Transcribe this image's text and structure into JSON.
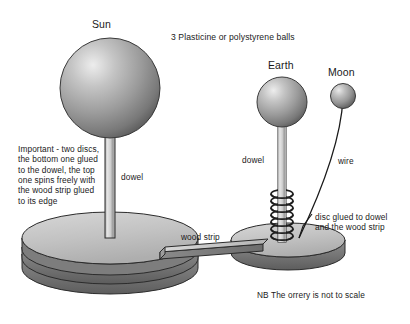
{
  "diagram": {
    "title_visible": false,
    "background_color": "#ffffff",
    "text_color": "#1a1a1a",
    "labels": {
      "sun": "Sun",
      "earth": "Earth",
      "moon": "Moon",
      "balls_note": "3 Plasticine or polystyrene balls",
      "important_note": "Important - two discs,\nthe bottom one glued\nto the dowel, the top\none spins freely with\nthe wood strip glued\nto its edge",
      "dowel_sun": "dowel",
      "dowel_earth": "dowel",
      "wire": "wire",
      "disc_glued_note": "disc glued to dowel\nand the wood strip",
      "wood_strip": "wood strip",
      "scale_note": "NB The orrery is not to scale"
    },
    "parts": {
      "sun_ball": "sun-sphere",
      "earth_ball": "earth-sphere",
      "moon_ball": "moon-sphere",
      "sun_dowel": "sun-dowel-rod",
      "earth_dowel": "earth-dowel-rod",
      "moon_wire": "moon-wire",
      "sun_base": "sun-base-two-discs",
      "earth_base": "earth-base-disc",
      "wood_strip": "wood-strip-arm",
      "spring": "spring-coil"
    },
    "colors": {
      "sphere_light": "#e8e8e8",
      "sphere_mid": "#9a9a9a",
      "sphere_dark": "#5a5a5a",
      "disc_top": "#c9c9c9",
      "disc_side": "#6e6e6e",
      "dowel_light": "#dedede",
      "dowel_dark": "#8c8c8c",
      "outline": "#2b2b2b"
    }
  }
}
